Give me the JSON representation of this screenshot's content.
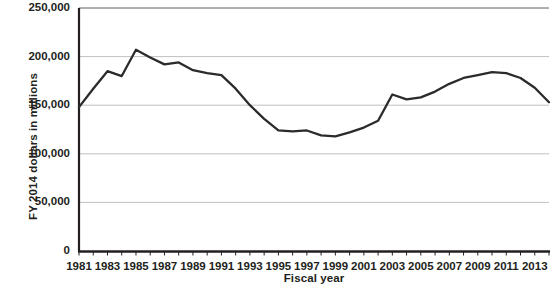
{
  "chart_data": {
    "type": "line",
    "title": "",
    "xlabel": "Fiscal year",
    "ylabel": "FY 2014 dollars in millions",
    "xlim": [
      1981,
      2014
    ],
    "ylim": [
      0,
      250000
    ],
    "grid": true,
    "legend": null,
    "line_color": "#2b2b2b",
    "x": [
      1981,
      1982,
      1983,
      1984,
      1985,
      1986,
      1987,
      1988,
      1989,
      1990,
      1991,
      1992,
      1993,
      1994,
      1995,
      1996,
      1997,
      1998,
      1999,
      2000,
      2001,
      2002,
      2003,
      2004,
      2005,
      2006,
      2007,
      2008,
      2009,
      2010,
      2011,
      2012,
      2013,
      2014
    ],
    "values": [
      148000,
      167000,
      185000,
      180000,
      207000,
      199000,
      192000,
      194000,
      186000,
      183000,
      181000,
      167000,
      150000,
      136000,
      124000,
      123000,
      124000,
      119000,
      118000,
      122000,
      127000,
      134000,
      161000,
      156000,
      158000,
      164000,
      172000,
      178000,
      181000,
      184000,
      183000,
      178000,
      168000,
      153000
    ],
    "ytick_values": [
      0,
      50000,
      100000,
      150000,
      200000,
      250000
    ],
    "ytick_labels": [
      "0",
      "50,000",
      "100,000",
      "150,000",
      "200,000",
      "250,000"
    ],
    "xtick_values": [
      1981,
      1983,
      1985,
      1987,
      1989,
      1991,
      1993,
      1995,
      1997,
      1999,
      2001,
      2003,
      2005,
      2007,
      2009,
      2011,
      2013
    ],
    "xtick_labels": [
      "1981",
      "1983",
      "1985",
      "1987",
      "1989",
      "1991",
      "1993",
      "1995",
      "1997",
      "1999",
      "2001",
      "2003",
      "2005",
      "2007",
      "2009",
      "2011",
      "2013"
    ],
    "xminor_values": [
      1982,
      1984,
      1986,
      1988,
      1990,
      1992,
      1994,
      1996,
      1998,
      2000,
      2002,
      2004,
      2006,
      2008,
      2010,
      2012,
      2014
    ]
  }
}
